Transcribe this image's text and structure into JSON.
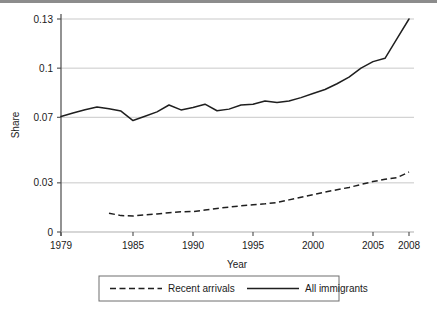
{
  "chart_data": {
    "type": "line",
    "title": "",
    "subtitle": "",
    "xlabel": "Year",
    "ylabel": "Share",
    "xlim": [
      1979,
      2008
    ],
    "ylim": [
      0,
      0.13
    ],
    "xticks": [
      1979,
      1985,
      1990,
      1995,
      2000,
      2005,
      2008
    ],
    "xticklabels": [
      "1979",
      "1985",
      "1990",
      "1995",
      "2000",
      "2005",
      "2008"
    ],
    "yticks": [
      0,
      0.03,
      0.07,
      0.1,
      0.13
    ],
    "yticklabels": [
      "0",
      "0.03",
      "0.07",
      "0.1",
      "0.13"
    ],
    "grid": "horizontal",
    "legend_position": "below-plot",
    "series": [
      {
        "name": "Recent arrivals",
        "style": "dashed",
        "color": "#1f1f1f",
        "x": [
          1983,
          1984,
          1985,
          1986,
          1987,
          1988,
          1989,
          1990,
          1991,
          1992,
          1993,
          1994,
          1995,
          1996,
          1997,
          1998,
          1999,
          2000,
          2001,
          2002,
          2003,
          2004,
          2005,
          2006,
          2007,
          2008
        ],
        "values": [
          0.0115,
          0.01,
          0.0098,
          0.0104,
          0.011,
          0.0118,
          0.0124,
          0.0125,
          0.0134,
          0.0144,
          0.0152,
          0.016,
          0.0166,
          0.0172,
          0.018,
          0.0196,
          0.0212,
          0.0228,
          0.0244,
          0.0258,
          0.0272,
          0.029,
          0.0308,
          0.0322,
          0.0332,
          0.0366
        ]
      },
      {
        "name": "All immigrants",
        "style": "solid",
        "color": "#1f1f1f",
        "x": [
          1979,
          1980,
          1981,
          1982,
          1983,
          1984,
          1985,
          1986,
          1987,
          1988,
          1989,
          1990,
          1991,
          1992,
          1993,
          1994,
          1995,
          1996,
          1997,
          1998,
          1999,
          2000,
          2001,
          2002,
          2003,
          2004,
          2005,
          2006,
          2007,
          2008
        ],
        "values": [
          0.0705,
          0.0726,
          0.0746,
          0.0763,
          0.0752,
          0.0738,
          0.068,
          0.0706,
          0.0733,
          0.0775,
          0.0745,
          0.076,
          0.078,
          0.074,
          0.075,
          0.0775,
          0.078,
          0.08,
          0.079,
          0.08,
          0.082,
          0.0845,
          0.087,
          0.0905,
          0.0945,
          0.1,
          0.104,
          0.106,
          0.118,
          0.13
        ]
      }
    ],
    "legend": [
      {
        "label": "Recent arrivals",
        "style": "dashed"
      },
      {
        "label": "All immigrants",
        "style": "solid"
      }
    ]
  }
}
